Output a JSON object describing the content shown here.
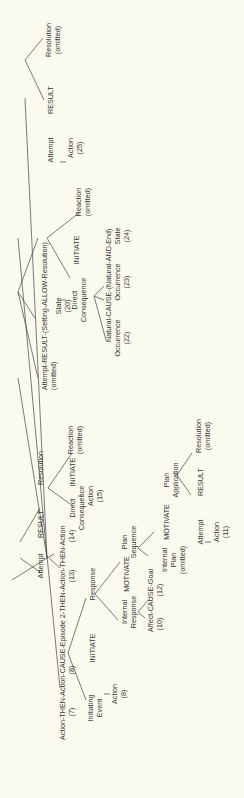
{
  "diagram": {
    "type": "story-grammar-tree",
    "orientation": "rotated-90-ccw",
    "nodes": {
      "root_episode2": {
        "label": "Action-THEN-Action-CAUSE-Episode 2-THEN-Action-THEN-Action",
        "nums": [
          "(7)",
          "(8)",
          "(13)",
          "(14)"
        ]
      },
      "attempt1": {
        "label": "Attempt"
      },
      "result1": {
        "label": "RESULT"
      },
      "resolution1": {
        "label": "Resolution"
      },
      "direct_consequence1": {
        "label": "Direct",
        "label2": "Consequence"
      },
      "dc1_action": {
        "label": "Action",
        "num": "(15)"
      },
      "initiate1": {
        "label": "INITIATE"
      },
      "reaction1": {
        "label": "Reaction",
        "sub": "(omitted)"
      },
      "attempt_result_setting": {
        "label": "Attempt-RESULT-(Setting-ALLOW-Resolution)",
        "sub": "(omitted)"
      },
      "state20": {
        "label": "State",
        "num": "(20)"
      },
      "direct_consequence2": {
        "label": "Direct",
        "label2": "Consequence"
      },
      "initiate2": {
        "label": "INITIATE"
      },
      "reaction2": {
        "label": "Reaction",
        "sub": "(omitted)"
      },
      "natural_cause": {
        "label": "Natural-CAUSE-(Natural-AND-End)"
      },
      "occ22": {
        "label": "Occurrence",
        "num": "(22)"
      },
      "occ23": {
        "label": "Occurrence",
        "num": "(23)"
      },
      "state24": {
        "label": "State",
        "num": "(24)"
      },
      "attempt3": {
        "label": "Attempt"
      },
      "result3": {
        "label": "RESULT"
      },
      "resolution3": {
        "label": "Resolution",
        "sub": "(omitted)"
      },
      "action25": {
        "label": "Action",
        "num": "(25)"
      },
      "initiating_event": {
        "label": "Initiating",
        "label2": "Event"
      },
      "ie_action": {
        "label": "Action",
        "num": "(8)"
      },
      "initiate_ep": {
        "label": "INITIATE"
      },
      "response": {
        "label": "Response"
      },
      "internal_response": {
        "label": "Internal",
        "label2": "Response"
      },
      "motivate1": {
        "label": "MOTIVATE"
      },
      "plan_sequence": {
        "label": "Plan",
        "label2": "Sequence"
      },
      "affect_cause_goal": {
        "label": "Affect-CAUSE-Goal",
        "nums": [
          "(10)",
          "(12)"
        ]
      },
      "internal_plan": {
        "label": "Internal",
        "label2": "Plan",
        "sub": "(omitted)"
      },
      "motivate2": {
        "label": "MOTIVATE"
      },
      "plan_application": {
        "label": "Plan",
        "label2": "Application"
      },
      "attempt2": {
        "label": "Attempt"
      },
      "result2": {
        "label": "RESULT"
      },
      "resolution2": {
        "label": "Resolution",
        "sub": "(omitted)"
      },
      "action11": {
        "label": "Action",
        "num": "(11)"
      }
    }
  },
  "colors": {
    "background": "#fbfaee",
    "ink": "#333333"
  }
}
